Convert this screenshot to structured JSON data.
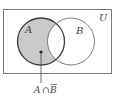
{
  "diagram": {
    "type": "venn",
    "universe_label": "U",
    "sets": [
      {
        "label": "A",
        "shaded": true
      },
      {
        "label": "B",
        "shaded": false
      }
    ],
    "highlighted_region": "A minus B",
    "pointer_label": "A ∩ B̄",
    "pointer_label_parts": {
      "left": "A",
      "op": "∩",
      "right": "B"
    },
    "colors": {
      "shade": "#c9c9c9",
      "set_a_stroke": "#3a3a3a",
      "set_b_stroke": "#7a7a7a",
      "universe_stroke": "#7a7a7a",
      "text": "#444444"
    }
  }
}
